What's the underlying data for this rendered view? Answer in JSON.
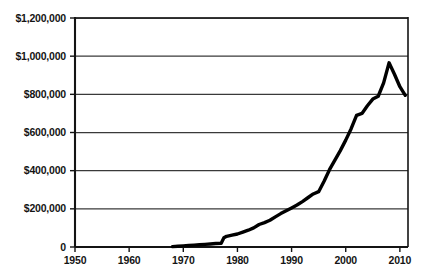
{
  "chart_data": {
    "type": "line",
    "title": "",
    "subtitle": "",
    "xlabel": "",
    "ylabel": "",
    "xlim": [
      1950,
      2011.5
    ],
    "ylim": [
      0,
      1200000
    ],
    "grid": true,
    "grid_axis": "y",
    "legend": "none",
    "xticks": [
      1950,
      1960,
      1970,
      1980,
      1990,
      2000,
      2010
    ],
    "xtick_labels": [
      "1950",
      "1960",
      "1970",
      "1980",
      "1990",
      "2000",
      "2010"
    ],
    "yticks": [
      0,
      200000,
      400000,
      600000,
      800000,
      1000000,
      1200000
    ],
    "ytick_labels": [
      "0",
      "$200,000",
      "$400,000",
      "$600,000",
      "$800,000",
      "$1,000,000",
      "$1,200,000"
    ],
    "series": [
      {
        "name": "value",
        "color": "#000000",
        "line_width": 3.4,
        "x": [
          1968,
          1969,
          1970,
          1971,
          1972,
          1973,
          1974,
          1975,
          1976,
          1977,
          1977.5,
          1978,
          1979,
          1980,
          1981,
          1982,
          1983,
          1984,
          1985,
          1986,
          1987,
          1988,
          1989,
          1990,
          1991,
          1992,
          1993,
          1994,
          1995,
          1996,
          1997,
          1998,
          1999,
          2000,
          2001,
          2002,
          2003,
          2004,
          2005,
          2006,
          2007,
          2008,
          2009,
          2010,
          2011
        ],
        "values": [
          2000,
          4000,
          6000,
          8000,
          10000,
          12000,
          14000,
          16000,
          18000,
          20000,
          48000,
          56000,
          62000,
          68000,
          78000,
          88000,
          100000,
          118000,
          128000,
          140000,
          158000,
          175000,
          190000,
          205000,
          220000,
          238000,
          258000,
          278000,
          290000,
          345000,
          405000,
          455000,
          505000,
          560000,
          620000,
          690000,
          700000,
          740000,
          775000,
          790000,
          860000,
          965000,
          905000,
          840000,
          795000
        ]
      }
    ],
    "annotations": [],
    "peak": {
      "x": 2008,
      "y": 965000
    },
    "end": {
      "x": 2011,
      "y": 795000
    },
    "start": {
      "x": 1968,
      "y": 2000
    }
  },
  "style": {
    "axis_color": "#141414",
    "grid_color": "#3a3a3a",
    "line_color": "#000000",
    "background": "#ffffff"
  }
}
